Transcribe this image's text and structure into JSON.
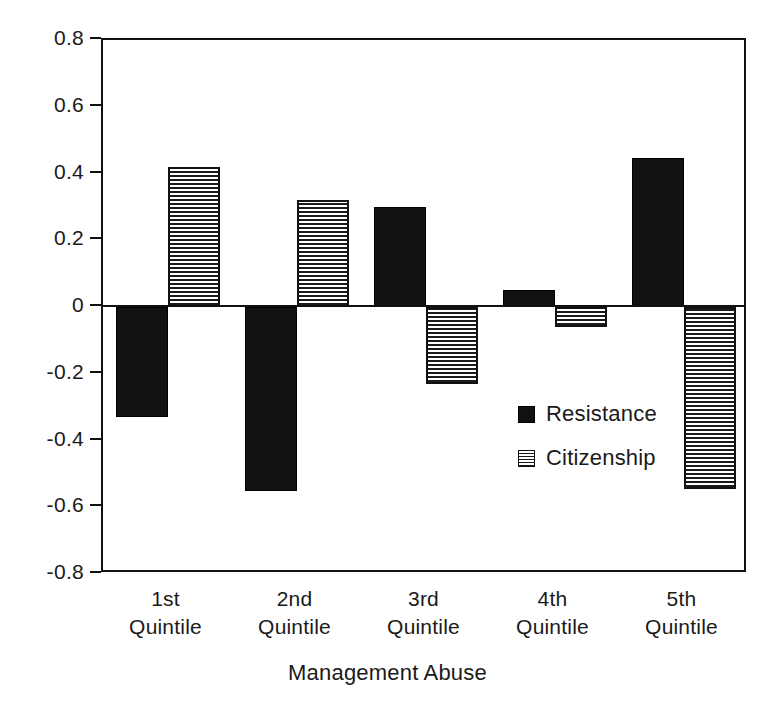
{
  "chart_data": {
    "type": "bar",
    "title": "",
    "subtitle": "",
    "xlabel": "Management Abuse",
    "ylabel": "",
    "categories": [
      "1st\nQuintile",
      "2nd\nQuintile",
      "3rd\nQuintile",
      "4th\nQuintile",
      "5th\nQuintile"
    ],
    "category_lines": [
      {
        "line1": "1st",
        "line2": "Quintile"
      },
      {
        "line1": "2nd",
        "line2": "Quintile"
      },
      {
        "line1": "3rd",
        "line2": "Quintile"
      },
      {
        "line1": "4th",
        "line2": "Quintile"
      },
      {
        "line1": "5th",
        "line2": "Quintile"
      }
    ],
    "series": [
      {
        "name": "Resistance",
        "fill": "solid",
        "color": "#111111",
        "values": [
          -0.33,
          -0.55,
          0.3,
          0.05,
          0.445
        ]
      },
      {
        "name": "Citizenship",
        "fill": "crosshatch",
        "color": "#1b1b1b",
        "values": [
          0.42,
          0.32,
          -0.23,
          -0.06,
          -0.545
        ]
      }
    ],
    "ylim": [
      -0.8,
      0.8
    ],
    "yticks": [
      0.8,
      0.6,
      0.4,
      0.2,
      0,
      -0.2,
      -0.4,
      -0.6,
      -0.8
    ],
    "ytick_labels": [
      "0.8",
      "0.6",
      "0.4",
      "0.2",
      "0",
      "-0.2",
      "-0.4",
      "-0.6",
      "-0.8"
    ],
    "grid": false,
    "legend_position": "inside-right-middle",
    "baseline": 0
  },
  "legend": {
    "entries": [
      {
        "label": "Resistance",
        "swatch": "solid-black-square"
      },
      {
        "label": "Citizenship",
        "swatch": "crosshatch-square"
      }
    ]
  },
  "axis": {
    "x_title": "Management Abuse"
  },
  "colors": {
    "axis": "#111111",
    "series_resistance": "#111111",
    "series_citizenship": "#1b1b1b",
    "background": "#ffffff"
  }
}
